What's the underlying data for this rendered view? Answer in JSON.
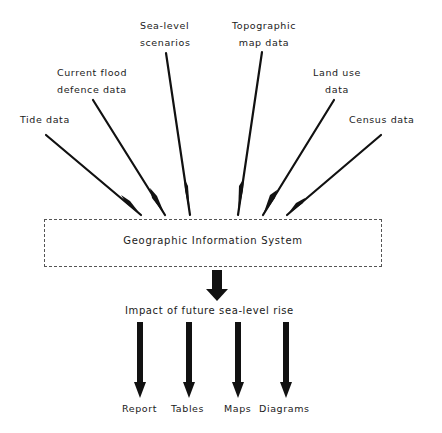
{
  "inputs": [
    {
      "id": "tide",
      "label_lines": [
        "Tide data"
      ]
    },
    {
      "id": "flood-defence",
      "label_lines": [
        "Current flood",
        "defence data"
      ]
    },
    {
      "id": "sea-level",
      "label_lines": [
        "Sea-level",
        "scenarios"
      ]
    },
    {
      "id": "topographic",
      "label_lines": [
        "Topographic",
        "map data"
      ]
    },
    {
      "id": "land-use",
      "label_lines": [
        "Land use",
        "data"
      ]
    },
    {
      "id": "census",
      "label_lines": [
        "Census data"
      ]
    }
  ],
  "system": {
    "label": "Geographic Information System"
  },
  "result": {
    "label": "Impact of future sea-level rise"
  },
  "outputs": [
    {
      "id": "report",
      "label": "Report"
    },
    {
      "id": "tables",
      "label": "Tables"
    },
    {
      "id": "maps",
      "label": "Maps"
    },
    {
      "id": "diagrams",
      "label": "Diagrams"
    }
  ],
  "colors": {
    "line": "#111111",
    "box_border": "#555555",
    "background": "#ffffff"
  }
}
